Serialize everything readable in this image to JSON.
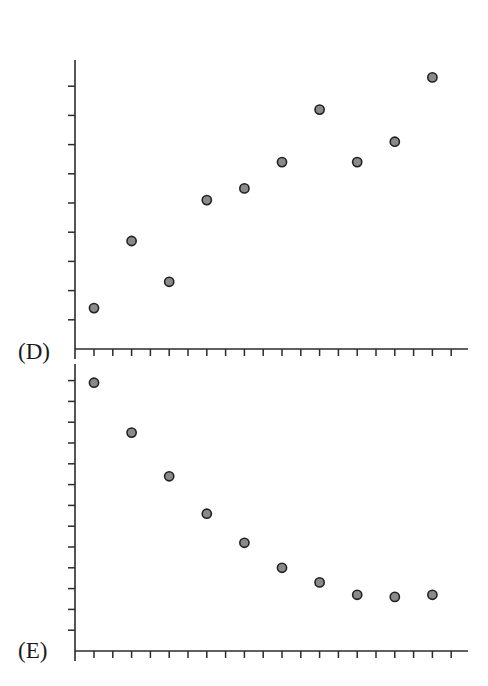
{
  "panels": [
    {
      "label": "(D)"
    },
    {
      "label": "(E)"
    }
  ],
  "style": {
    "axis_color": "#2b2b2b",
    "marker_fill": "#8a8a8a",
    "marker_stroke": "#222222"
  },
  "chart_data": [
    {
      "type": "scatter",
      "title": "(D)",
      "xlabel": "",
      "ylabel": "",
      "x": [
        1,
        2,
        3,
        4,
        5,
        6,
        7,
        8,
        9,
        10
      ],
      "values": [
        1.4,
        3.7,
        2.3,
        5.1,
        5.5,
        6.4,
        8.2,
        6.4,
        7.1,
        9.3
      ],
      "ylim": [
        0,
        10
      ],
      "xlim": [
        0.5,
        10.5
      ],
      "y_ticks": 10,
      "x_ticks": 20,
      "tick_labels": false,
      "grid": false,
      "legend": null
    },
    {
      "type": "scatter",
      "title": "(E)",
      "xlabel": "",
      "ylabel": "",
      "x": [
        1,
        2,
        3,
        4,
        5,
        6,
        7,
        8,
        9,
        10
      ],
      "values": [
        12.9,
        10.5,
        8.4,
        6.6,
        5.2,
        4.0,
        3.3,
        2.7,
        2.6,
        2.7
      ],
      "ylim": [
        0,
        13.5
      ],
      "xlim": [
        0.5,
        10.5
      ],
      "y_ticks": 13,
      "x_ticks": 20,
      "tick_labels": false,
      "grid": false,
      "legend": null
    }
  ]
}
